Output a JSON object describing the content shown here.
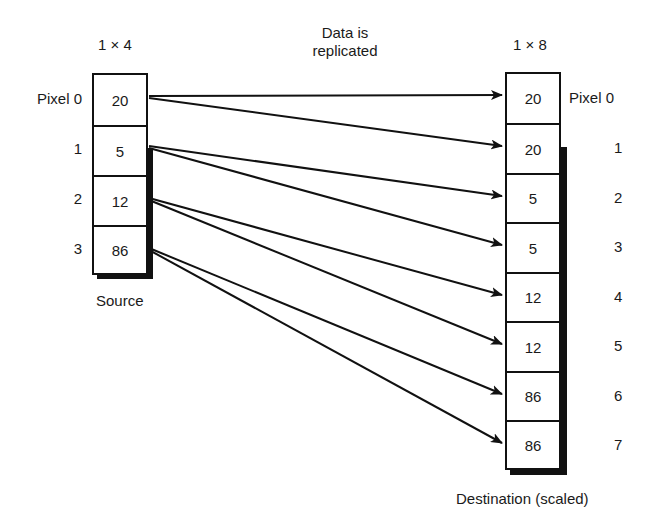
{
  "source": {
    "dims_label": "1 × 4",
    "caption": "Source",
    "row_labels": [
      "Pixel 0",
      "1",
      "2",
      "3"
    ],
    "values": [
      "20",
      "5",
      "12",
      "86"
    ]
  },
  "destination": {
    "dims_label": "1 × 8",
    "caption": "Destination (scaled)",
    "row_labels": [
      "Pixel 0",
      "1",
      "2",
      "3",
      "4",
      "5",
      "6",
      "7"
    ],
    "values": [
      "20",
      "20",
      "5",
      "5",
      "12",
      "12",
      "86",
      "86"
    ]
  },
  "annotation": {
    "line1": "Data is",
    "line2": "replicated"
  },
  "mapping": [
    {
      "from": 0,
      "to": 0
    },
    {
      "from": 0,
      "to": 1
    },
    {
      "from": 1,
      "to": 2
    },
    {
      "from": 1,
      "to": 3
    },
    {
      "from": 2,
      "to": 4
    },
    {
      "from": 2,
      "to": 5
    },
    {
      "from": 3,
      "to": 6
    },
    {
      "from": 3,
      "to": 7
    }
  ]
}
